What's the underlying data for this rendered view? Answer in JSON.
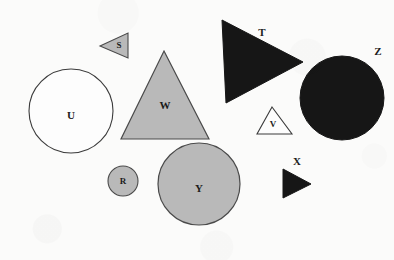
{
  "figure": {
    "type": "shape-layout-diagram",
    "background_color": "#fbfbfa",
    "width": 394,
    "height": 260,
    "outline_color": "#3b3b3b",
    "fill_gray": "#b8b8b8",
    "fill_black": "#161616",
    "fill_white": "#fdfdfd"
  },
  "shapes": [
    {
      "id": "S",
      "label": "S",
      "kind": "triangle",
      "orientation": "left-pointing",
      "fill": "gray",
      "fill_color": "#b9b9b9",
      "points": "128,33 128,58 100,46",
      "label_x": 119,
      "label_y": 46,
      "label_on_shape": true
    },
    {
      "id": "T",
      "label": "T",
      "kind": "triangle",
      "orientation": "right-pointing",
      "fill": "black",
      "fill_color": "#161616",
      "points": "222,20 303,62 226,103",
      "label_x": 262,
      "label_y": 33,
      "label_on_shape": false
    },
    {
      "id": "U",
      "label": "U",
      "kind": "circle",
      "fill": "white",
      "fill_color": "#fdfdfd",
      "cx": 71,
      "cy": 111,
      "r": 42,
      "label_x": 71,
      "label_y": 116,
      "label_on_shape": true
    },
    {
      "id": "V",
      "label": "V",
      "kind": "triangle",
      "orientation": "up-pointing",
      "fill": "white",
      "fill_color": "#fdfdfd",
      "points": "272,107 292,134 257,134",
      "label_x": 273,
      "label_y": 124,
      "label_on_shape": true
    },
    {
      "id": "W",
      "label": "W",
      "kind": "triangle",
      "orientation": "up-pointing",
      "fill": "gray",
      "fill_color": "#b9b9b9",
      "points": "164,51 209,139 121,139",
      "label_x": 165,
      "label_y": 106,
      "label_on_shape": true
    },
    {
      "id": "X",
      "label": "X",
      "kind": "triangle",
      "orientation": "right-pointing",
      "fill": "black",
      "fill_color": "#161616",
      "points": "283,169 311,184 283,198",
      "label_x": 297,
      "label_y": 162,
      "label_on_shape": false
    },
    {
      "id": "Y",
      "label": "Y",
      "kind": "circle",
      "fill": "gray",
      "fill_color": "#b9b9b9",
      "cx": 199,
      "cy": 184,
      "r": 41,
      "label_x": 199,
      "label_y": 189,
      "label_on_shape": true
    },
    {
      "id": "Z",
      "label": "Z",
      "kind": "circle",
      "fill": "black",
      "fill_color": "#161616",
      "cx": 342,
      "cy": 98,
      "r": 42,
      "label_x": 378,
      "label_y": 52,
      "label_on_shape": false
    },
    {
      "id": "R",
      "label": "R",
      "kind": "circle",
      "fill": "gray",
      "fill_color": "#b9b9b9",
      "cx": 123,
      "cy": 181,
      "r": 15,
      "label_x": 123,
      "label_y": 182,
      "label_on_shape": true
    }
  ]
}
